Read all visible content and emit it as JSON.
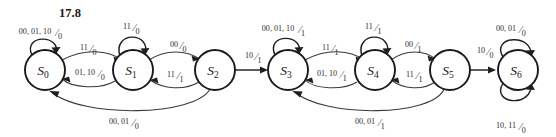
{
  "figure": {
    "title": "17.8",
    "type": "finite-state-machine-diagram"
  },
  "states": [
    {
      "id": "s0",
      "label": "S",
      "subscript": "0",
      "cx": 45,
      "cy": 70,
      "r": 20
    },
    {
      "id": "s1",
      "label": "S",
      "subscript": "1",
      "cx": 133,
      "cy": 70,
      "r": 20
    },
    {
      "id": "s2",
      "label": "S",
      "subscript": "2",
      "cx": 215,
      "cy": 70,
      "r": 20
    },
    {
      "id": "s3",
      "label": "S",
      "subscript": "3",
      "cx": 288,
      "cy": 70,
      "r": 20
    },
    {
      "id": "s4",
      "label": "S",
      "subscript": "4",
      "cx": 375,
      "cy": 70,
      "r": 20
    },
    {
      "id": "s5",
      "label": "S",
      "subscript": "5",
      "cx": 450,
      "cy": 70,
      "r": 20
    },
    {
      "id": "s6",
      "label": "S",
      "subscript": "6",
      "cx": 518,
      "cy": 70,
      "r": 20
    }
  ],
  "transitions": [
    {
      "id": "t-s0-self",
      "from": "s0",
      "to": "s0",
      "inputs": "00, 01, 10",
      "output": "0",
      "label": "00, 01, 10/0",
      "lx": 38,
      "ly": 34
    },
    {
      "id": "t-s0-s1",
      "from": "s0",
      "to": "s1",
      "inputs": "11",
      "output": "0",
      "label": "11/0",
      "lx": 87,
      "ly": 50
    },
    {
      "id": "t-s1-s0",
      "from": "s1",
      "to": "s0",
      "inputs": "01, 10",
      "output": "0",
      "label": "01, 10/0",
      "lx": 88,
      "ly": 75
    },
    {
      "id": "t-s1-self",
      "from": "s1",
      "to": "s1",
      "inputs": "11",
      "output": "0",
      "label": "11/0",
      "lx": 130,
      "ly": 29
    },
    {
      "id": "t-s1-s2",
      "from": "s1",
      "to": "s2",
      "inputs": "00",
      "output": "0",
      "label": "00/0",
      "lx": 177,
      "ly": 47
    },
    {
      "id": "t-s2-s1",
      "from": "s2",
      "to": "s1",
      "inputs": "11",
      "output": "1",
      "label": "11/1",
      "lx": 174,
      "ly": 77
    },
    {
      "id": "t-s2-s0",
      "from": "s2",
      "to": "s0",
      "inputs": "00, 01",
      "output": "0",
      "label": "00, 01/0",
      "lx": 122,
      "ly": 124
    },
    {
      "id": "t-s2-s3",
      "from": "s2",
      "to": "s3",
      "inputs": "10",
      "output": "1",
      "label": "10/1",
      "lx": 252,
      "ly": 58
    },
    {
      "id": "t-s3-self",
      "from": "s3",
      "to": "s3",
      "inputs": "00, 01, 10",
      "output": "1",
      "label": "00, 01, 10/1",
      "lx": 281,
      "ly": 31
    },
    {
      "id": "t-s3-s4",
      "from": "s3",
      "to": "s4",
      "inputs": "11",
      "output": "1",
      "label": "11/1",
      "lx": 329,
      "ly": 50
    },
    {
      "id": "t-s4-s3",
      "from": "s4",
      "to": "s3",
      "inputs": "01, 10",
      "output": "1",
      "label": "01, 10/1",
      "lx": 330,
      "ly": 76
    },
    {
      "id": "t-s4-self",
      "from": "s4",
      "to": "s4",
      "inputs": "11",
      "output": "1",
      "label": "11/1",
      "lx": 372,
      "ly": 29
    },
    {
      "id": "t-s4-s5",
      "from": "s4",
      "to": "s5",
      "inputs": "00",
      "output": "1",
      "label": "00/1",
      "lx": 412,
      "ly": 47
    },
    {
      "id": "t-s5-s4",
      "from": "s5",
      "to": "s4",
      "inputs": "11",
      "output": "1",
      "label": "11/1",
      "lx": 413,
      "ly": 77
    },
    {
      "id": "t-s5-s3",
      "from": "s5",
      "to": "s3",
      "inputs": "00, 01",
      "output": "1",
      "label": "00, 01/1",
      "lx": 368,
      "ly": 124
    },
    {
      "id": "t-s5-s6",
      "from": "s5",
      "to": "s6",
      "inputs": "10",
      "output": "0",
      "label": "10/0",
      "lx": 484,
      "ly": 53
    },
    {
      "id": "t-s6-self-a",
      "from": "s6",
      "to": "s6",
      "inputs": "00, 01",
      "output": "0",
      "label": "00, 01/0",
      "lx": 509,
      "ly": 31
    },
    {
      "id": "t-s6-self-b",
      "from": "s6",
      "to": "s6",
      "inputs": "10, 11",
      "output": "0",
      "label": "10, 11/0",
      "lx": 509,
      "ly": 128
    }
  ],
  "colors": {
    "background": "#ffffff",
    "state_stroke": "#1a1a1a",
    "edge_stroke": "#3a3a3a",
    "text": "#1a1a1a"
  }
}
